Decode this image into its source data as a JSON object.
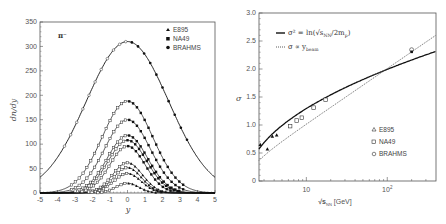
{
  "chart_data": [
    {
      "type": "scatter",
      "title": "",
      "annotation": "π⁻",
      "xlabel": "y",
      "ylabel": "dn/dy",
      "xlim": [
        -5,
        5
      ],
      "ylim": [
        0,
        350
      ],
      "x_ticks": [
        "-5",
        "-4",
        "-3",
        "-2",
        "-1",
        "0",
        "1",
        "2",
        "3",
        "4",
        "5"
      ],
      "y_ticks": [
        "0",
        "50",
        "100",
        "150",
        "200",
        "250",
        "300",
        "350"
      ],
      "grid": false,
      "legend_position": "top-right",
      "legend": [
        {
          "label": "E895",
          "marker": "triangle-filled"
        },
        {
          "label": "NA49",
          "marker": "square-filled"
        },
        {
          "label": "BRAHMS",
          "marker": "circle-filled"
        }
      ],
      "series": [
        {
          "name": "BRAHMS fit",
          "amplitude": 310,
          "sigma": 2.35
        },
        {
          "name": "NA49 158 AGeV fit",
          "amplitude": 188,
          "sigma": 1.45
        },
        {
          "name": "NA49 80 AGeV fit",
          "amplitude": 150,
          "sigma": 1.3
        },
        {
          "name": "NA49 40 AGeV fit",
          "amplitude": 118,
          "sigma": 1.15
        },
        {
          "name": "NA49 30 AGeV fit",
          "amplitude": 108,
          "sigma": 1.1
        },
        {
          "name": "NA49 20 AGeV fit",
          "amplitude": 96,
          "sigma": 1.0
        },
        {
          "name": "E895 8 AGeV fit",
          "amplitude": 62,
          "sigma": 0.85
        },
        {
          "name": "E895 6 AGeV fit",
          "amplitude": 52,
          "sigma": 0.8
        },
        {
          "name": "E895 4 AGeV fit",
          "amplitude": 40,
          "sigma": 0.78
        },
        {
          "name": "E895 2 AGeV fit",
          "amplitude": 20,
          "sigma": 0.65
        }
      ],
      "note": "Gaussian fits, filled markers at y>0 measured, open markers at y<0 reflected"
    },
    {
      "type": "scatter",
      "title": "",
      "xlabel": "√s_NN [GeV]",
      "ylabel": "σ",
      "x_scale": "log",
      "xlim": [
        2.6,
        400
      ],
      "ylim": [
        0,
        3.0
      ],
      "x_ticks": [
        "10",
        "10²"
      ],
      "y_ticks": [
        "0",
        "0.5",
        "1.0",
        "1.5",
        "2.0",
        "2.5",
        "3.0"
      ],
      "grid": false,
      "legend_top": [
        {
          "label": "σ² = ln(√s_NN / 2m_p)",
          "style": "solid"
        },
        {
          "label": "σ ∝ y_beam",
          "style": "dotted"
        }
      ],
      "legend_bottom": [
        {
          "label": "E895",
          "marker": "triangle-open"
        },
        {
          "label": "NA49",
          "marker": "square-open"
        },
        {
          "label": "BRAHMS",
          "marker": "circle-open"
        }
      ],
      "series": [
        {
          "name": "E895",
          "x": [
            2.7,
            3.3,
            3.8,
            4.3
          ],
          "y": [
            0.65,
            0.57,
            0.8,
            0.82
          ]
        },
        {
          "name": "NA49",
          "x": [
            6.3,
            7.6,
            8.8,
            12.3,
            17.3
          ],
          "y": [
            0.98,
            1.08,
            1.13,
            1.31,
            1.45
          ]
        },
        {
          "name": "BRAHMS",
          "x": [
            200
          ],
          "y": [
            2.33
          ]
        }
      ]
    }
  ],
  "left": {
    "annotation": "π⁻",
    "xlabel": "y",
    "ylabel": "dn/dy",
    "legend": [
      "E895",
      "NA49",
      "BRAHMS"
    ],
    "x_ticks": [
      "-5",
      "-4",
      "-3",
      "-2",
      "-1",
      "0",
      "1",
      "2",
      "3",
      "4",
      "5"
    ],
    "y_ticks": [
      "0",
      "50",
      "100",
      "150",
      "200",
      "250",
      "300",
      "350"
    ]
  },
  "right": {
    "ylabel": "σ",
    "xlabel_main": "√s",
    "xlabel_sub": "NN",
    "xlabel_unit": "[GeV]",
    "formula1": "σ² = ln(√s",
    "formula1_sub": "NN",
    "formula1_tail": "/2m",
    "formula1_sub2": "p",
    "formula1_end": ")",
    "formula2": "σ ∝ y",
    "formula2_sub": "beam",
    "legend": [
      "E895",
      "NA49",
      "BRAHMS"
    ],
    "x_ticks": [
      "10",
      "10"
    ],
    "x_tick_exp": "2",
    "y_ticks": [
      "0",
      "0.5",
      "1.0",
      "1.5",
      "2.0",
      "2.5",
      "3.0"
    ]
  }
}
